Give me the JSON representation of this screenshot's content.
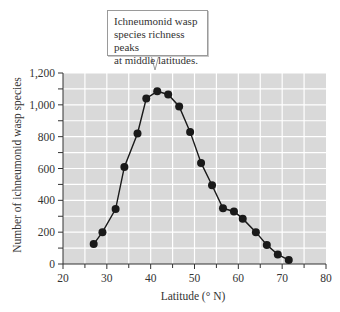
{
  "callout": {
    "text": "Ichneumonid wasp species richness peaks at middle latitudes.",
    "lines": [
      "Ichneumonid wasp",
      "species richness peaks",
      "at middle latitudes."
    ]
  },
  "colors": {
    "plot_background": "#d9d9d9",
    "gridline": "#ffffff",
    "series": "#1a1a1a",
    "axis": "#333333"
  },
  "chart_data": {
    "type": "line",
    "title": "",
    "annotation": "Ichneumonid wasp species richness peaks at middle latitudes.",
    "xlabel": "Latitude (° N)",
    "ylabel": "Number of ichneumonid wasp species",
    "xlim": [
      20,
      80
    ],
    "ylim": [
      0,
      1200
    ],
    "x_ticks": [
      20,
      30,
      40,
      50,
      60,
      70,
      80
    ],
    "x_tick_labels": [
      "20",
      "30",
      "40",
      "50",
      "60",
      "70",
      "80"
    ],
    "y_ticks": [
      0,
      200,
      400,
      600,
      800,
      1000,
      1200
    ],
    "y_tick_labels": [
      "0",
      "200",
      "400",
      "600",
      "800",
      "1,000",
      "1,200"
    ],
    "grid": true,
    "legend": null,
    "series": [
      {
        "name": "Ichneumonid wasp species",
        "markers": true,
        "x": [
          27,
          29,
          32,
          34,
          37,
          39,
          41.5,
          44,
          46.5,
          49,
          51.5,
          54,
          56.5,
          59,
          61,
          64,
          66.5,
          69,
          71.5
        ],
        "values": [
          125,
          200,
          345,
          610,
          820,
          1040,
          1085,
          1065,
          990,
          830,
          635,
          495,
          350,
          330,
          285,
          200,
          120,
          60,
          25
        ]
      }
    ]
  }
}
